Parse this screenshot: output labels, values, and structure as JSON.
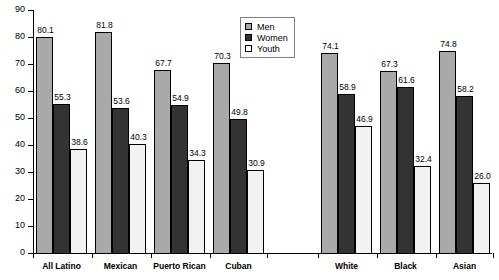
{
  "chart_data": {
    "type": "bar",
    "title": "",
    "xlabel": "",
    "ylabel": "",
    "ylim": [
      0,
      90
    ],
    "yticks": [
      0,
      10,
      20,
      30,
      40,
      50,
      60,
      70,
      80,
      90
    ],
    "grid": false,
    "legend_position": "top-center",
    "categories": [
      "All Latino",
      "Mexican",
      "Puerto Rican",
      "Cuban",
      "White",
      "Black",
      "Asian"
    ],
    "series": [
      {
        "name": "Men",
        "color": "#a9a9a9",
        "values": [
          80.1,
          81.8,
          67.7,
          70.3,
          74.1,
          67.3,
          74.8
        ]
      },
      {
        "name": "Women",
        "color": "#333333",
        "values": [
          55.3,
          53.6,
          54.9,
          49.8,
          58.9,
          61.6,
          58.2
        ]
      },
      {
        "name": "Youth",
        "color": "#f2f2f2",
        "values": [
          38.6,
          40.3,
          34.3,
          30.9,
          46.9,
          32.4,
          26.0
        ]
      }
    ]
  },
  "axis": {
    "y_tick_labels": [
      "0",
      "10",
      "20",
      "30",
      "40",
      "50",
      "60",
      "70",
      "80",
      "90"
    ]
  },
  "legend": {
    "items": [
      {
        "label": "Men"
      },
      {
        "label": "Women"
      },
      {
        "label": "Youth"
      }
    ]
  },
  "group_labels": [
    "All Latino",
    "Mexican",
    "Puerto Rican",
    "Cuban",
    "White",
    "Black",
    "Asian"
  ],
  "bar_labels": [
    [
      "80.1",
      "55.3",
      "38.6"
    ],
    [
      "81.8",
      "53.6",
      "40.3"
    ],
    [
      "67.7",
      "54.9",
      "34.3"
    ],
    [
      "70.3",
      "49.8",
      "30.9"
    ],
    [
      "74.1",
      "58.9",
      "46.9"
    ],
    [
      "67.3",
      "61.6",
      "32.4"
    ],
    [
      "74.8",
      "58.2",
      "26.0"
    ]
  ]
}
